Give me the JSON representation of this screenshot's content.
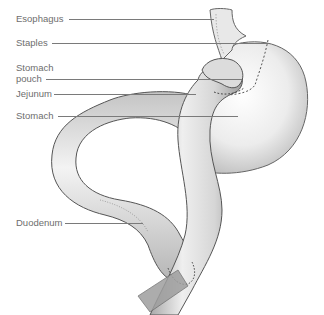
{
  "diagram": {
    "type": "anatomical-illustration",
    "labels": [
      {
        "id": "esophagus",
        "text": "Esophagus"
      },
      {
        "id": "staples",
        "text": "Staples"
      },
      {
        "id": "stomach-pouch-line1",
        "text": "Stomach"
      },
      {
        "id": "stomach-pouch-line2",
        "text": "pouch"
      },
      {
        "id": "jejunum",
        "text": "Jejunum"
      },
      {
        "id": "stomach",
        "text": "Stomach"
      },
      {
        "id": "duodenum",
        "text": "Duodenum"
      }
    ],
    "colors": {
      "label_text": "#6e6e6e",
      "leader_line": "#7a7a7a",
      "organ_outline": "#555555",
      "organ_fill_light": "#f4f4f4",
      "organ_fill_dark": "#9a9a9a"
    }
  }
}
